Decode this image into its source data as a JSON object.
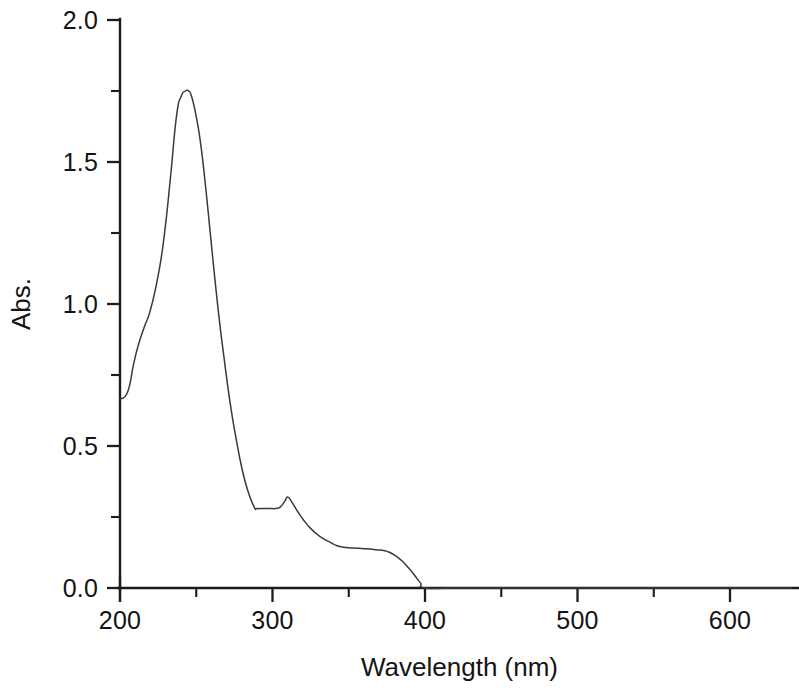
{
  "chart_data": {
    "type": "line",
    "title": "",
    "subtitle": "",
    "xlabel": "Wavelength (nm)",
    "ylabel": "Abs.",
    "xlim": [
      190,
      640
    ],
    "ylim": [
      0.0,
      2.0
    ],
    "grid": false,
    "legend": null,
    "x_ticks_major": [
      200,
      300,
      400,
      500,
      600
    ],
    "x_tick_labels": [
      "200",
      "300",
      "400",
      "500",
      "600"
    ],
    "x_ticks_minor": [
      250,
      350,
      450,
      550
    ],
    "y_ticks_major": [
      0.0,
      0.5,
      1.0,
      1.5,
      2.0
    ],
    "y_tick_labels": [
      "0.0",
      "0.5",
      "1.0",
      "1.5",
      "2.0"
    ],
    "y_ticks_minor": [
      0.25,
      0.75,
      1.25,
      1.75
    ],
    "series": [
      {
        "name": "Absorbance",
        "color": "#3a3a3a",
        "x": [
          200,
          205,
          209,
          212,
          216,
          220,
          225,
          229,
          233,
          237,
          240,
          243,
          245,
          247,
          250,
          253,
          256,
          259,
          262,
          265,
          268,
          272,
          276,
          280,
          284,
          288,
          290,
          294,
          298,
          302,
          305,
          308,
          310,
          313,
          317,
          321,
          325,
          329,
          333,
          337,
          341,
          345,
          350,
          356,
          362,
          368,
          373,
          377,
          381,
          385,
          389,
          393,
          397,
          400,
          420,
          460,
          500,
          560,
          620,
          640
        ],
        "y": [
          0.665,
          0.69,
          0.79,
          0.855,
          0.92,
          0.98,
          1.1,
          1.24,
          1.44,
          1.66,
          1.73,
          1.75,
          1.75,
          1.73,
          1.66,
          1.56,
          1.42,
          1.26,
          1.1,
          0.95,
          0.82,
          0.66,
          0.53,
          0.42,
          0.34,
          0.285,
          0.28,
          0.28,
          0.28,
          0.28,
          0.285,
          0.305,
          0.32,
          0.3,
          0.265,
          0.235,
          0.21,
          0.19,
          0.175,
          0.163,
          0.152,
          0.145,
          0.142,
          0.14,
          0.138,
          0.135,
          0.132,
          0.125,
          0.112,
          0.095,
          0.072,
          0.046,
          0.018,
          0.0,
          0.0,
          0.0,
          0.0,
          0.0,
          0.0,
          0.0
        ]
      }
    ],
    "annotations": {
      "peak_wavelength_nm": 245,
      "peak_absorbance": 1.75,
      "shoulder_wavelength_nm": 310,
      "shoulder_absorbance": 0.32
    }
  },
  "axes": {
    "y_title": "Abs.",
    "x_title": "Wavelength (nm)"
  }
}
